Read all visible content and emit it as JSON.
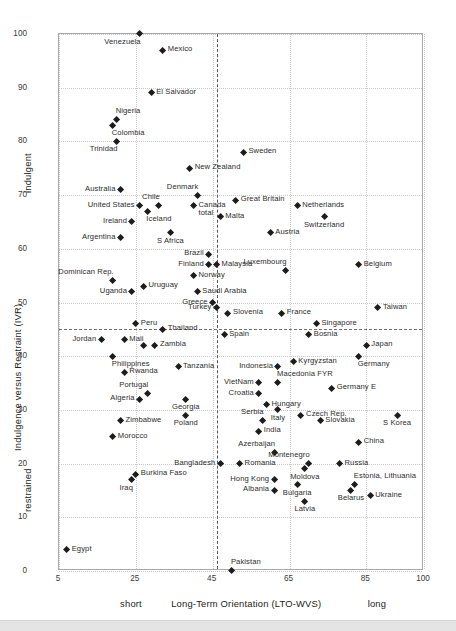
{
  "chart_data": {
    "type": "scatter",
    "title": "",
    "xlabel": "Long-Term Orientation (LTO-WVS)",
    "ylabel": "Indulgence versus Restraint (IVR)",
    "xlim": [
      5,
      100
    ],
    "ylim": [
      0,
      100
    ],
    "xticks": [
      5,
      25,
      45,
      65,
      85,
      100
    ],
    "yticks": [
      0,
      10,
      20,
      30,
      40,
      50,
      60,
      70,
      80,
      90,
      100
    ],
    "grid": true,
    "legend": null,
    "x_axis_low_label": "short",
    "x_axis_high_label": "long",
    "y_axis_high_label": "indulgent",
    "y_axis_low_label": "restrained",
    "reference_lines": {
      "horizontal_y": 45,
      "vertical_x": 46
    },
    "points": [
      {
        "label": "Venezuela",
        "x": 26,
        "y": 100,
        "pos": "bl"
      },
      {
        "label": "Mexico",
        "x": 32,
        "y": 97,
        "pos": "r"
      },
      {
        "label": "El Salvador",
        "x": 29,
        "y": 89,
        "pos": "r"
      },
      {
        "label": "Nigeria",
        "x": 20,
        "y": 84,
        "pos": "tr"
      },
      {
        "label": "Colombia",
        "x": 19,
        "y": 83,
        "pos": "br"
      },
      {
        "label": "Trinidad",
        "x": 20,
        "y": 80,
        "pos": "bl"
      },
      {
        "label": "Sweden",
        "x": 53,
        "y": 78,
        "pos": "r"
      },
      {
        "label": "New Zealand",
        "x": 39,
        "y": 75,
        "pos": "r"
      },
      {
        "label": "Australia",
        "x": 21,
        "y": 71,
        "pos": "l"
      },
      {
        "label": "Denmark",
        "x": 41,
        "y": 70,
        "pos": "tl"
      },
      {
        "label": "Great Britain",
        "x": 51,
        "y": 69,
        "pos": "r"
      },
      {
        "label": "United States",
        "x": 26,
        "y": 68,
        "pos": "l"
      },
      {
        "label": "Chile",
        "x": 31,
        "y": 68,
        "pos": "tl"
      },
      {
        "label": "Canada\ntotal",
        "x": 40,
        "y": 68,
        "pos": "r"
      },
      {
        "label": "Netherlands",
        "x": 67,
        "y": 68,
        "pos": "r"
      },
      {
        "label": "Iceland",
        "x": 28,
        "y": 67,
        "pos": "br"
      },
      {
        "label": "Malta",
        "x": 47,
        "y": 66,
        "pos": "r"
      },
      {
        "label": "Switzerland",
        "x": 74,
        "y": 66,
        "pos": "b"
      },
      {
        "label": "Ireland",
        "x": 24,
        "y": 65,
        "pos": "l"
      },
      {
        "label": "S Africa",
        "x": 34,
        "y": 63,
        "pos": "b"
      },
      {
        "label": "Austria",
        "x": 60,
        "y": 63,
        "pos": "r"
      },
      {
        "label": "Argentina",
        "x": 21,
        "y": 62,
        "pos": "l"
      },
      {
        "label": "Brazil",
        "x": 44,
        "y": 59,
        "pos": "l"
      },
      {
        "label": "Finland",
        "x": 44,
        "y": 57,
        "pos": "l"
      },
      {
        "label": "Malaysia",
        "x": 46,
        "y": 57,
        "pos": "r"
      },
      {
        "label": "Belgium",
        "x": 83,
        "y": 57,
        "pos": "r"
      },
      {
        "label": "Luxembourg",
        "x": 64,
        "y": 56,
        "pos": "tl"
      },
      {
        "label": "Norway",
        "x": 40,
        "y": 55,
        "pos": "r"
      },
      {
        "label": "Dominican Rep.",
        "x": 19,
        "y": 54,
        "pos": "tl"
      },
      {
        "label": "Uruguay",
        "x": 27,
        "y": 53,
        "pos": "r"
      },
      {
        "label": "Uganda",
        "x": 24,
        "y": 52,
        "pos": "l"
      },
      {
        "label": "Saudi Arabia",
        "x": 41,
        "y": 52,
        "pos": "r"
      },
      {
        "label": "Greece",
        "x": 45,
        "y": 50,
        "pos": "l"
      },
      {
        "label": "Taiwan",
        "x": 88,
        "y": 49,
        "pos": "r"
      },
      {
        "label": "Turkey",
        "x": 46,
        "y": 49,
        "pos": "l"
      },
      {
        "label": "Slovenia",
        "x": 49,
        "y": 48,
        "pos": "r"
      },
      {
        "label": "France",
        "x": 63,
        "y": 48,
        "pos": "r"
      },
      {
        "label": "Peru",
        "x": 25,
        "y": 46,
        "pos": "r"
      },
      {
        "label": "Singapore",
        "x": 72,
        "y": 46,
        "pos": "r"
      },
      {
        "label": "Thailand",
        "x": 32,
        "y": 45,
        "pos": "r"
      },
      {
        "label": "Spain",
        "x": 48,
        "y": 44,
        "pos": "r"
      },
      {
        "label": "Bosnia",
        "x": 70,
        "y": 44,
        "pos": "r"
      },
      {
        "label": "Jordan",
        "x": 16,
        "y": 43,
        "pos": "l"
      },
      {
        "label": "Mali",
        "x": 22,
        "y": 43,
        "pos": "r"
      },
      {
        "label": "Japan",
        "x": 85,
        "y": 42,
        "pos": "r"
      },
      {
        "label": "Thailand2",
        "x": 27,
        "y": 42,
        "pos": "tr"
      },
      {
        "label": "Zambia",
        "x": 30,
        "y": 42,
        "pos": "r"
      },
      {
        "label": "Philippines",
        "x": 19,
        "y": 40,
        "pos": "br"
      },
      {
        "label": "Germany",
        "x": 83,
        "y": 40,
        "pos": "br"
      },
      {
        "label": "Kyrgyzstan",
        "x": 66,
        "y": 39,
        "pos": "r"
      },
      {
        "label": "Tanzania",
        "x": 36,
        "y": 38,
        "pos": "r"
      },
      {
        "label": "Indonesia",
        "x": 62,
        "y": 38,
        "pos": "l"
      },
      {
        "label": "Rwanda",
        "x": 22,
        "y": 37,
        "pos": "r"
      },
      {
        "label": "VietNam",
        "x": 57,
        "y": 35,
        "pos": "l"
      },
      {
        "label": "Macedonia FYR",
        "x": 62,
        "y": 35,
        "pos": "tr"
      },
      {
        "label": "Germany E",
        "x": 76,
        "y": 34,
        "pos": "r"
      },
      {
        "label": "Croatia",
        "x": 57,
        "y": 33,
        "pos": "l"
      },
      {
        "label": "Portugal",
        "x": 28,
        "y": 33,
        "pos": "tl"
      },
      {
        "label": "Algeria",
        "x": 26,
        "y": 32,
        "pos": "l"
      },
      {
        "label": "Georgia",
        "x": 38,
        "y": 32,
        "pos": "b"
      },
      {
        "label": "Hungary",
        "x": 59,
        "y": 31,
        "pos": "r"
      },
      {
        "label": "Italy",
        "x": 62,
        "y": 30,
        "pos": "b"
      },
      {
        "label": "Czech Rep.",
        "x": 68,
        "y": 29,
        "pos": "r"
      },
      {
        "label": "Poland",
        "x": 38,
        "y": 29,
        "pos": "b"
      },
      {
        "label": "S Korea",
        "x": 93,
        "y": 29,
        "pos": "b"
      },
      {
        "label": "Serbia",
        "x": 58,
        "y": 28,
        "pos": "tl"
      },
      {
        "label": "Zimbabwe",
        "x": 21,
        "y": 28,
        "pos": "r"
      },
      {
        "label": "Slovakia",
        "x": 73,
        "y": 28,
        "pos": "r"
      },
      {
        "label": "India",
        "x": 57,
        "y": 26,
        "pos": "r"
      },
      {
        "label": "Morocco",
        "x": 19,
        "y": 25,
        "pos": "r"
      },
      {
        "label": "China",
        "x": 83,
        "y": 24,
        "pos": "r"
      },
      {
        "label": "Azerbaijan",
        "x": 61,
        "y": 22,
        "pos": "tl"
      },
      {
        "label": "Bangladesh",
        "x": 47,
        "y": 20,
        "pos": "l"
      },
      {
        "label": "Romania",
        "x": 52,
        "y": 20,
        "pos": "r"
      },
      {
        "label": "Montenegro",
        "x": 70,
        "y": 20,
        "pos": "tl"
      },
      {
        "label": "Russia",
        "x": 78,
        "y": 20,
        "pos": "r"
      },
      {
        "label": "Moldova",
        "x": 69,
        "y": 19,
        "pos": "b"
      },
      {
        "label": "Burkina Faso",
        "x": 25,
        "y": 18,
        "pos": "r"
      },
      {
        "label": "Iraq",
        "x": 24,
        "y": 17,
        "pos": "bl"
      },
      {
        "label": "Hong Kong",
        "x": 61,
        "y": 17,
        "pos": "l"
      },
      {
        "label": "Estonia, Lithuania",
        "x": 82,
        "y": 16,
        "pos": "tr"
      },
      {
        "label": "Bulgaria",
        "x": 67,
        "y": 16,
        "pos": "b"
      },
      {
        "label": "Albania",
        "x": 61,
        "y": 15,
        "pos": "l"
      },
      {
        "label": "Belarus",
        "x": 81,
        "y": 15,
        "pos": "b"
      },
      {
        "label": "Ukraine",
        "x": 86,
        "y": 14,
        "pos": "r"
      },
      {
        "label": "Latvia",
        "x": 69,
        "y": 13,
        "pos": "b"
      },
      {
        "label": "Egypt",
        "x": 7,
        "y": 4,
        "pos": "r"
      },
      {
        "label": "Pakistan",
        "x": 50,
        "y": 0,
        "pos": "tr"
      }
    ]
  }
}
